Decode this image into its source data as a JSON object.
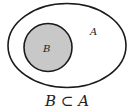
{
  "diagram": {
    "type": "venn-subset",
    "outer_set": {
      "label": "A",
      "fill": "#ffffff",
      "stroke": "#1a1a1a"
    },
    "inner_set": {
      "label": "B",
      "fill": "#c8c8c8",
      "stroke": "#1a1a1a"
    },
    "caption": "B ⊂ A"
  }
}
